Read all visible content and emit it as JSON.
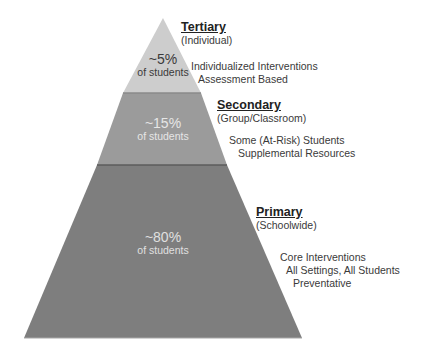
{
  "diagram": {
    "type": "pyramid",
    "colors": {
      "tertiary": "#cdcdcd",
      "secondary": "#999999",
      "primary": "#7d7d7d",
      "divider": "#5a5a5a"
    },
    "tiers": [
      {
        "id": "tertiary",
        "title": "Tertiary",
        "scope": "(Individual)",
        "percent": "~5%",
        "percent_sub": "of students",
        "descriptions": [
          "Individualized Interventions",
          "Assessment Based"
        ]
      },
      {
        "id": "secondary",
        "title": "Secondary",
        "scope": "(Group/Classroom)",
        "percent": "~15%",
        "percent_sub": "of students",
        "descriptions": [
          "Some (At-Risk) Students",
          "Supplemental Resources"
        ]
      },
      {
        "id": "primary",
        "title": "Primary",
        "scope": "(Schoolwide)",
        "percent": "~80%",
        "percent_sub": "of students",
        "descriptions": [
          "Core Interventions",
          "All Settings, All Students",
          "Preventative"
        ]
      }
    ]
  }
}
